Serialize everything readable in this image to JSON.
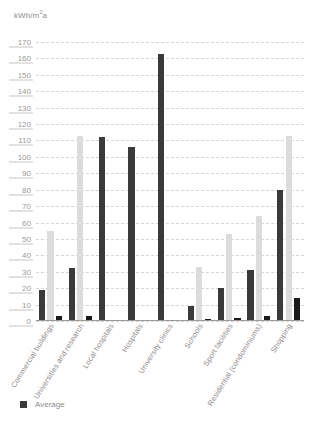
{
  "axis_unit_prefix": "kWh/m",
  "axis_unit_sup": "2",
  "axis_unit_suffix": "a",
  "legend": {
    "items": [
      {
        "label": "Average",
        "color": "#3a3a3a",
        "marker": "square-swatch"
      }
    ]
  },
  "colors": {
    "average": "#3a3a3a",
    "maximum": "#dcdcdc",
    "minimum": "#1a1a1a",
    "gridline": "#d9d4d4",
    "tick_text": "#9a9a9a",
    "label_text": "#8e8a8a",
    "background": "#ffffff"
  },
  "chart_data": {
    "type": "bar",
    "title": "",
    "subtitle": "",
    "xlabel": "",
    "ylabel": "kWh/m2a",
    "ylim": [
      0,
      170
    ],
    "ytick_step": 10,
    "yticks": [
      0,
      10,
      20,
      30,
      40,
      50,
      60,
      70,
      80,
      90,
      100,
      110,
      120,
      130,
      140,
      150,
      160,
      170
    ],
    "grid": true,
    "legend_position": "bottom-left",
    "categories": [
      "Commercial buildings",
      "Universities and research",
      "Local hospitals",
      "Hospitals",
      "University clinics",
      "Schools",
      "Sport facilities",
      "Residential (condominiums)",
      "Shopping"
    ],
    "series": [
      {
        "name": "Average",
        "color": "#3a3a3a",
        "values": [
          19,
          32,
          112,
          106,
          163,
          9,
          20,
          31,
          80
        ]
      },
      {
        "name": "Maximum",
        "color": "#dcdcdc",
        "values": [
          55,
          113,
          0,
          0,
          0,
          33,
          53,
          64,
          113
        ]
      },
      {
        "name": "Minimum",
        "color": "#1a1a1a",
        "values": [
          3,
          3,
          0,
          0,
          0,
          1,
          2,
          3,
          14
        ]
      }
    ]
  }
}
